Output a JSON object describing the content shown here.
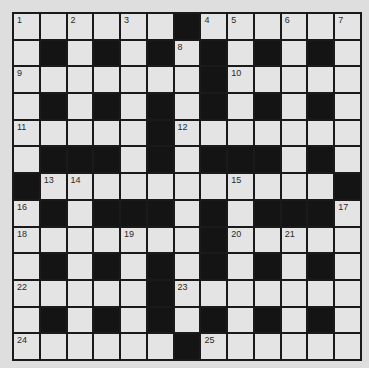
{
  "puzzle": {
    "type": "crossword",
    "rows": 13,
    "cols": 13,
    "colors": {
      "background": "#dedede",
      "cell": "#e4e4e4",
      "block": "#141414",
      "gridline": "#1a1a1a"
    },
    "grid": [
      "WWWWWWBWWWWWW",
      "WBWBWBWBWBWBW",
      "WWWWWWWBWWWWW",
      "WBWBWBWBWBWBW",
      "WWWWWBWWWWWWW",
      "WBBBWBWBBBWBW",
      "BWWWWWWWWWWWB",
      "WBWBBBWBWBBBW",
      "WWWWWWWBWWWWW",
      "WBWBWBWBWBWBW",
      "WWWWWBWWWWWWW",
      "WBWBWBWBWBWBW",
      "WWWWWWBWWWWWW"
    ],
    "numbers": [
      {
        "r": 0,
        "c": 0,
        "n": "1"
      },
      {
        "r": 0,
        "c": 2,
        "n": "2"
      },
      {
        "r": 0,
        "c": 4,
        "n": "3"
      },
      {
        "r": 0,
        "c": 7,
        "n": "4"
      },
      {
        "r": 0,
        "c": 8,
        "n": "5"
      },
      {
        "r": 0,
        "c": 10,
        "n": "6"
      },
      {
        "r": 0,
        "c": 12,
        "n": "7"
      },
      {
        "r": 1,
        "c": 6,
        "n": "8"
      },
      {
        "r": 2,
        "c": 0,
        "n": "9"
      },
      {
        "r": 2,
        "c": 8,
        "n": "10"
      },
      {
        "r": 4,
        "c": 0,
        "n": "11"
      },
      {
        "r": 4,
        "c": 6,
        "n": "12"
      },
      {
        "r": 6,
        "c": 1,
        "n": "13"
      },
      {
        "r": 6,
        "c": 2,
        "n": "14"
      },
      {
        "r": 6,
        "c": 8,
        "n": "15"
      },
      {
        "r": 7,
        "c": 0,
        "n": "16"
      },
      {
        "r": 7,
        "c": 12,
        "n": "17"
      },
      {
        "r": 8,
        "c": 0,
        "n": "18"
      },
      {
        "r": 8,
        "c": 4,
        "n": "19"
      },
      {
        "r": 8,
        "c": 8,
        "n": "20"
      },
      {
        "r": 8,
        "c": 10,
        "n": "21"
      },
      {
        "r": 10,
        "c": 0,
        "n": "22"
      },
      {
        "r": 10,
        "c": 6,
        "n": "23"
      },
      {
        "r": 12,
        "c": 0,
        "n": "24"
      },
      {
        "r": 12,
        "c": 7,
        "n": "25"
      }
    ]
  }
}
